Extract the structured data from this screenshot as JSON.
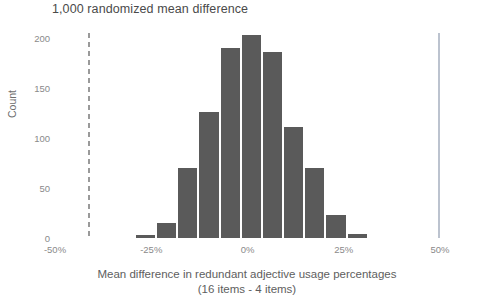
{
  "chart_data": {
    "type": "bar",
    "title": "1,000 randomized mean difference",
    "subtitle": "",
    "xlabel": "Mean difference in redundant adjective usage percentages",
    "xlabel_line2": "(16 items - 4 items)",
    "ylabel": "Count",
    "xlim": [
      -50,
      50
    ],
    "ylim": [
      0,
      205
    ],
    "grid": false,
    "legend": null,
    "bin_width": 5.5,
    "bar_color": "#5a5a5a",
    "xtick_labels": [
      "-50%",
      "-25%",
      "0%",
      "25%",
      "50%"
    ],
    "xtick_values": [
      -50,
      -25,
      0,
      25,
      50
    ],
    "ytick_labels": [
      "0",
      "50",
      "100",
      "150",
      "200"
    ],
    "ytick_values": [
      0,
      50,
      100,
      150,
      200
    ],
    "bins": [
      {
        "center": -26.5,
        "value": 3
      },
      {
        "center": -21.0,
        "value": 15
      },
      {
        "center": -15.5,
        "value": 70
      },
      {
        "center": -10.0,
        "value": 126
      },
      {
        "center": -4.5,
        "value": 190
      },
      {
        "center": 1.0,
        "value": 203
      },
      {
        "center": 6.5,
        "value": 186
      },
      {
        "center": 12.0,
        "value": 111
      },
      {
        "center": 17.5,
        "value": 70
      },
      {
        "center": 23.0,
        "value": 23
      },
      {
        "center": 28.5,
        "value": 4
      }
    ],
    "annotations": [
      {
        "name": "reference-line-dashed",
        "type": "vline",
        "x": -41.5,
        "style": "dashed",
        "color": "#9a9a9a"
      },
      {
        "name": "observed-value-line",
        "type": "vline",
        "x": 49.5,
        "style": "solid",
        "color": "#bcc3cf"
      }
    ]
  }
}
